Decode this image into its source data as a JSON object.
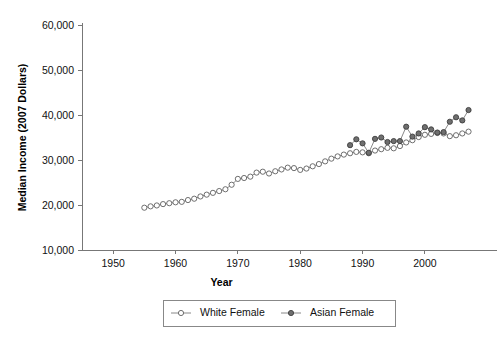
{
  "chart_data": {
    "type": "line",
    "title": "",
    "xlabel": "Year",
    "ylabel": "Median Income (2007 Dollars)",
    "xlim": [
      1945,
      2009
    ],
    "ylim": [
      10000,
      60000
    ],
    "grid": false,
    "legend_position": "bottom-center",
    "y_ticks": [
      10000,
      20000,
      30000,
      40000,
      50000,
      60000
    ],
    "y_tick_labels": [
      "10,000",
      "20,000",
      "30,000",
      "40,000",
      "50,000",
      "60,000"
    ],
    "x_ticks": [
      1950,
      1960,
      1970,
      1980,
      1990,
      2000
    ],
    "x_tick_labels": [
      "1950",
      "1960",
      "1970",
      "1980",
      "1990",
      "2000"
    ],
    "series": [
      {
        "name": "White Female",
        "marker": "open-circle",
        "color": "#5f5f5f",
        "x": [
          1955,
          1956,
          1957,
          1958,
          1959,
          1960,
          1961,
          1962,
          1963,
          1964,
          1965,
          1966,
          1967,
          1968,
          1969,
          1970,
          1971,
          1972,
          1973,
          1974,
          1975,
          1976,
          1977,
          1978,
          1979,
          1980,
          1981,
          1982,
          1983,
          1984,
          1985,
          1986,
          1987,
          1988,
          1989,
          1990,
          1991,
          1992,
          1993,
          1994,
          1995,
          1996,
          1997,
          1998,
          1999,
          2000,
          2001,
          2002,
          2003,
          2004,
          2005,
          2006,
          2007
        ],
        "values": [
          19400,
          19700,
          19900,
          20200,
          20400,
          20600,
          20700,
          21100,
          21400,
          21900,
          22300,
          22700,
          23100,
          23500,
          24500,
          25800,
          26000,
          26300,
          27200,
          27400,
          27000,
          27500,
          27900,
          28300,
          28200,
          27800,
          28100,
          28600,
          29100,
          29700,
          30300,
          30800,
          31200,
          31500,
          31800,
          31700,
          31500,
          32100,
          32400,
          32700,
          32600,
          33100,
          33900,
          34400,
          35100,
          35600,
          35800,
          36000,
          35900,
          35300,
          35500,
          35900,
          36300
        ]
      },
      {
        "name": "Asian Female",
        "marker": "filled-circle",
        "color": "#6f6f6f",
        "x": [
          1988,
          1989,
          1990,
          1991,
          1992,
          1993,
          1994,
          1995,
          1996,
          1997,
          1998,
          1999,
          2000,
          2001,
          2002,
          2003,
          2004,
          2005,
          2006,
          2007
        ],
        "values": [
          33300,
          34600,
          33700,
          31600,
          34700,
          35000,
          34000,
          34200,
          34200,
          37400,
          35200,
          35900,
          37300,
          36800,
          36100,
          36200,
          38500,
          39500,
          38800,
          41100
        ]
      }
    ]
  },
  "legend": {
    "items": [
      {
        "label": "White Female",
        "marker": "open-circle"
      },
      {
        "label": "Asian Female",
        "marker": "filled-circle"
      }
    ]
  }
}
